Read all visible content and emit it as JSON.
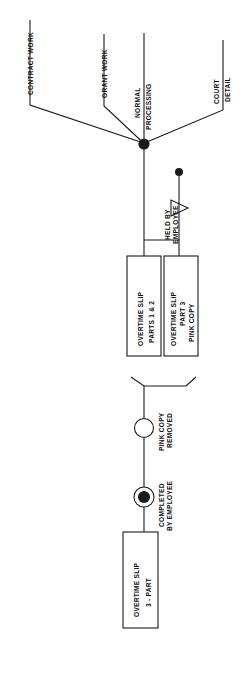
{
  "diagram": {
    "orientation": "rotated-90-ccw",
    "background_color": "#ffffff",
    "line_color": "#1a1a1a",
    "text_color": "#111111",
    "branch_labels": [
      {
        "id": "contract-work",
        "text": "CONTRACT WORK"
      },
      {
        "id": "grant-work",
        "text": "GRANT WORK"
      },
      {
        "id": "normal-processing-line1",
        "text": "NORMAL"
      },
      {
        "id": "normal-processing-line2",
        "text": "PROCESSING"
      },
      {
        "id": "court",
        "text": "COURT"
      },
      {
        "id": "detail",
        "text": "DETAIL"
      }
    ],
    "annotations": [
      {
        "id": "held-by-employee-line1",
        "text": "HELD BY"
      },
      {
        "id": "held-by-employee-line2",
        "text": "EMPLOYEE"
      },
      {
        "id": "pink-copy-removed-line1",
        "text": "PINK COPY"
      },
      {
        "id": "pink-copy-removed-line2",
        "text": "REMOVED"
      },
      {
        "id": "completed-by-employee-line1",
        "text": "COMPLETED"
      },
      {
        "id": "completed-by-employee-line2",
        "text": "BY EMPLOYEE"
      }
    ],
    "document_boxes": [
      {
        "id": "overtime-slip-parts-1-2",
        "line1": "OVERTIME SLIP",
        "line2": "PARTS 1 & 2",
        "line3": ""
      },
      {
        "id": "overtime-slip-part-3-pink-copy",
        "line1": "OVERTIME SLIP",
        "line2": "PART 3",
        "line3": "PINK COPY"
      },
      {
        "id": "overtime-slip-3-part",
        "line1": "OVERTIME SLIP",
        "line2": "3 - PART",
        "line3": ""
      }
    ],
    "symbols": [
      {
        "id": "branch-junction-node",
        "kind": "filled-dot"
      },
      {
        "id": "held-by-employee-terminator-dot",
        "kind": "filled-dot"
      },
      {
        "id": "held-by-employee-triangle",
        "kind": "triangle"
      },
      {
        "id": "merge-bracket",
        "kind": "bracket"
      },
      {
        "id": "pink-copy-removed-circle",
        "kind": "open-circle"
      },
      {
        "id": "completed-by-employee-circle",
        "kind": "circle-with-filled-dot"
      }
    ]
  }
}
